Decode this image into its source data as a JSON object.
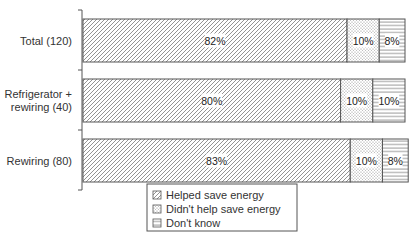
{
  "chart_data": {
    "type": "bar",
    "orientation": "horizontal",
    "stacked": true,
    "categories": [
      [
        "Total (120)"
      ],
      [
        "Refrigerator +",
        "rewiring (40)"
      ],
      [
        "Rewiring (80)"
      ]
    ],
    "series": [
      {
        "name": "Helped save energy",
        "pattern": "diagonal-hatch",
        "values": [
          82,
          80,
          83
        ],
        "labels": [
          "82%",
          "80%",
          "83%"
        ]
      },
      {
        "name": "Didn't help save energy",
        "pattern": "dots",
        "values": [
          10,
          10,
          10
        ],
        "labels": [
          "10%",
          "10%",
          "10%"
        ]
      },
      {
        "name": "Don't know",
        "pattern": "horizontal-lines",
        "values": [
          8,
          10,
          8
        ],
        "labels": [
          "8%",
          "10%",
          "8%"
        ]
      }
    ],
    "xlim": [
      0,
      100
    ],
    "title": "",
    "xlabel": "",
    "ylabel": "",
    "legend_position": "bottom-center",
    "grid": false
  },
  "colors": {
    "stroke": "#555555",
    "text": "#333333",
    "background": "#ffffff"
  }
}
